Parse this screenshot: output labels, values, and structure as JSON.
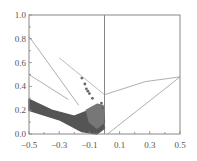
{
  "chart_data": {
    "type": "scatter",
    "title": "",
    "xlabel": "",
    "ylabel": "",
    "xlim": [
      -0.5,
      0.5
    ],
    "ylim": [
      0.0,
      1.0
    ],
    "grid": false,
    "legend": null,
    "x_ticks": [
      "-0.5",
      "-0.3",
      "-0.1",
      "0.1",
      "0.3",
      "0.5"
    ],
    "y_ticks": [
      "0.0",
      "0.2",
      "0.4",
      "0.6",
      "0.8",
      "1.0"
    ],
    "reference_lines": [
      {
        "name": "vertical-zero-line",
        "points": [
          [
            0.0,
            0.0
          ],
          [
            0.0,
            1.0
          ]
        ],
        "color": "#666666"
      },
      {
        "name": "left-line-a",
        "points": [
          [
            -0.5,
            0.82
          ],
          [
            -0.17,
            0.24
          ]
        ],
        "color": "#999999"
      },
      {
        "name": "left-line-b",
        "points": [
          [
            -0.5,
            0.5
          ],
          [
            -0.24,
            0.29
          ]
        ],
        "color": "#999999"
      },
      {
        "name": "left-line-c",
        "points": [
          [
            -0.3,
            0.64
          ],
          [
            0.0,
            0.33
          ]
        ],
        "color": "#aaaaaa"
      },
      {
        "name": "right-upper-line",
        "points": [
          [
            0.0,
            0.33
          ],
          [
            0.27,
            0.44
          ],
          [
            0.5,
            0.48
          ]
        ],
        "color": "#999999"
      },
      {
        "name": "right-diagonal-line",
        "points": [
          [
            0.02,
            0.0
          ],
          [
            0.5,
            0.48
          ]
        ],
        "color": "#999999"
      }
    ],
    "series": [
      {
        "name": "dark-cluster",
        "color": "#555555",
        "description": "dense band from (-0.5, ~0.27) sloping down to (~-0.05, 0.0)",
        "envelope": [
          [
            -0.5,
            0.29
          ],
          [
            -0.35,
            0.2
          ],
          [
            -0.2,
            0.15
          ],
          [
            -0.1,
            0.2
          ],
          [
            -0.05,
            0.23
          ],
          [
            -0.02,
            0.2
          ],
          [
            0.0,
            0.05
          ],
          [
            -0.05,
            0.0
          ],
          [
            -0.15,
            0.02
          ],
          [
            -0.3,
            0.12
          ],
          [
            -0.5,
            0.2
          ]
        ]
      },
      {
        "name": "mid-cluster",
        "color": "#777777",
        "description": "lighter overlay near x=-0.1..0",
        "envelope": [
          [
            -0.12,
            0.2
          ],
          [
            -0.05,
            0.25
          ],
          [
            -0.01,
            0.24
          ],
          [
            0.0,
            0.1
          ],
          [
            -0.05,
            0.05
          ],
          [
            -0.1,
            0.1
          ]
        ]
      },
      {
        "name": "outliers",
        "color": "#666666",
        "points": [
          [
            -0.15,
            0.47
          ],
          [
            -0.13,
            0.42
          ],
          [
            -0.12,
            0.38
          ],
          [
            -0.11,
            0.36
          ],
          [
            -0.1,
            0.34
          ],
          [
            -0.08,
            0.3
          ],
          [
            -0.02,
            0.26
          ],
          [
            -0.01,
            0.22
          ]
        ]
      }
    ]
  }
}
